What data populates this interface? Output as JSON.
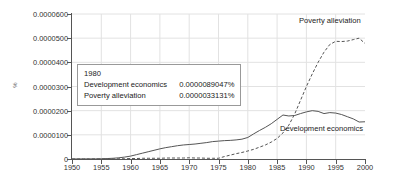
{
  "chart_data": {
    "type": "line",
    "title": "",
    "xlabel": "",
    "ylabel": "%",
    "xlim": [
      1950,
      2000
    ],
    "ylim": [
      0,
      6e-05
    ],
    "grid": true,
    "legend_position": "inline-right",
    "x_ticks": [
      1950,
      1955,
      1960,
      1965,
      1970,
      1975,
      1980,
      1985,
      1990,
      1995,
      2000
    ],
    "x_tick_labels": [
      "1950",
      "1955",
      "1960",
      "1965",
      "1970",
      "1975",
      "1980",
      "1985",
      "1990",
      "1995",
      "2000"
    ],
    "y_ticks": [
      0,
      1e-05,
      2e-05,
      3e-05,
      4e-05,
      5e-05,
      6e-05
    ],
    "y_tick_labels": [
      "0",
      "0.0000100",
      "0.0000200",
      "0.0000300",
      "0.0000400",
      "0.0000500",
      "0.0000600"
    ],
    "x": [
      1950,
      1951,
      1952,
      1953,
      1954,
      1955,
      1956,
      1957,
      1958,
      1959,
      1960,
      1961,
      1962,
      1963,
      1964,
      1965,
      1966,
      1967,
      1968,
      1969,
      1970,
      1971,
      1972,
      1973,
      1974,
      1975,
      1976,
      1977,
      1978,
      1979,
      1980,
      1981,
      1982,
      1983,
      1984,
      1985,
      1986,
      1987,
      1988,
      1989,
      1990,
      1991,
      1992,
      1993,
      1994,
      1995,
      1996,
      1997,
      1998,
      1999,
      2000
    ],
    "series": [
      {
        "name": "Development economics",
        "style": "solid",
        "color": "#555555",
        "values": [
          2e-08,
          3e-08,
          4e-08,
          5e-08,
          7e-08,
          1e-07,
          1.8e-07,
          3e-07,
          5e-07,
          8e-07,
          1.2e-06,
          1.8e-06,
          2.4e-06,
          3e-06,
          3.6e-06,
          4.2e-06,
          4.7e-06,
          5.1e-06,
          5.5e-06,
          5.8e-06,
          6e-06,
          6.2e-06,
          6.5e-06,
          6.8e-06,
          7.2e-06,
          7.4e-06,
          7.6e-06,
          7.7e-06,
          7.9e-06,
          8.2e-06,
          8.9047e-06,
          1.04e-05,
          1.18e-05,
          1.31e-05,
          1.46e-05,
          1.64e-05,
          1.82e-05,
          1.78e-05,
          1.8e-05,
          1.88e-05,
          1.95e-05,
          2e-05,
          1.97e-05,
          1.88e-05,
          1.92e-05,
          1.9e-05,
          1.84e-05,
          1.75e-05,
          1.66e-05,
          1.53e-05,
          1.54e-05
        ]
      },
      {
        "name": "Poverty alleviation",
        "style": "dashed",
        "color": "#555555",
        "values": [
          0.0,
          0.0,
          0.0,
          0.0,
          0.0,
          0.0,
          0.0,
          0.0,
          1e-07,
          1e-07,
          2e-07,
          2e-07,
          3e-07,
          3e-07,
          3e-07,
          3e-07,
          4e-07,
          4e-07,
          4e-07,
          4e-07,
          5e-07,
          4e-07,
          4e-07,
          3e-07,
          3e-07,
          3e-07,
          1e-06,
          1.6e-06,
          2.2e-06,
          2.7e-06,
          3.3131e-06,
          4e-06,
          4.9e-06,
          5.8e-06,
          7e-06,
          8.5e-06,
          1.08e-05,
          1.4e-05,
          1.86e-05,
          2.43e-05,
          3e-05,
          3.52e-05,
          4e-05,
          4.42e-05,
          4.74e-05,
          4.87e-05,
          4.86e-05,
          4.88e-05,
          4.94e-05,
          5e-05,
          4.78e-05
        ]
      }
    ],
    "annotations": {
      "tooltip": {
        "year": "1980",
        "rows": [
          {
            "name": "Development economics",
            "value": "0.0000089047%"
          },
          {
            "name": "Poverty alleviation",
            "value": "0.0000033131%"
          }
        ]
      },
      "inline_labels": [
        {
          "name": "Poverty alleviation",
          "text": "Poverty alleviation"
        },
        {
          "name": "Development economics",
          "text": "Development economics"
        }
      ]
    }
  }
}
